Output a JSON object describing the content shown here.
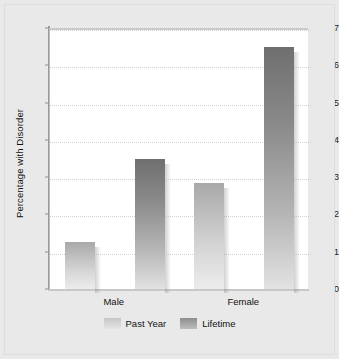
{
  "chart_data": {
    "type": "bar",
    "title": "",
    "subtitle": "",
    "xlabel": "",
    "ylabel": "Percentage with Disorder",
    "categories": [
      "Male",
      "Female"
    ],
    "series": [
      {
        "name": "Past Year",
        "values": [
          1.25,
          2.85
        ],
        "color": "#c6c6c6"
      },
      {
        "name": "Lifetime",
        "values": [
          3.5,
          6.5
        ],
        "color": "#8d8d8d"
      }
    ],
    "ylim": [
      0,
      7
    ],
    "y_ticks": [
      0,
      1,
      2,
      3,
      4,
      5,
      6,
      7
    ],
    "y_tick_labels": [
      "0",
      "1",
      "2",
      "3",
      "4",
      "5",
      "6",
      "7"
    ],
    "grid": true,
    "grid_style": "dotted",
    "grid_color": "#d3d3d3",
    "legend_position": "bottom-center",
    "background_color": "#e9e9e9",
    "plot_background_color": "#ffffff",
    "bar_style": "gradient-with-shadow"
  },
  "legend": {
    "items": [
      {
        "label": "Past Year"
      },
      {
        "label": "Lifetime"
      }
    ]
  }
}
